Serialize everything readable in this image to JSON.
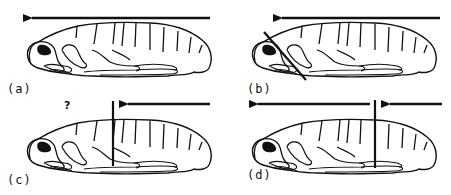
{
  "figure": {
    "title": "",
    "colors": {
      "ink": "#111111",
      "background": "#ffffff"
    },
    "panels": [
      {
        "id": "a",
        "label": "(a)",
        "arrows": [
          "full-length leftward arrow above body"
        ],
        "ligature": "none",
        "annotation": ""
      },
      {
        "id": "b",
        "label": "(b)",
        "arrows": [
          "leftward arrow starting behind head"
        ],
        "ligature": "diagonal line behind head",
        "annotation": ""
      },
      {
        "id": "c",
        "label": "(c)",
        "arrows": [
          "short leftward arrow from posterior ending at ligature"
        ],
        "ligature": "vertical line at mid-body",
        "annotation": "?"
      },
      {
        "id": "d",
        "label": "(d)",
        "arrows": [
          "long leftward arrow from ligature to anterior",
          "short leftward arrow from posterior to ligature"
        ],
        "ligature": "vertical line at mid-body",
        "annotation": ""
      }
    ]
  }
}
